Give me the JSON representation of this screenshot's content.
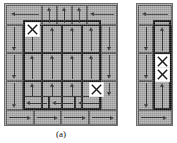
{
  "figure": {
    "caption": "(a)",
    "colors": {
      "grain_fill": "#a9a9a9",
      "grain_border": "#5a5a5a",
      "domain_wall": "#111111",
      "arrow": "#2e2e2e",
      "defect_box": "#ffffff",
      "page_background": "#ffffff"
    },
    "panels": [
      {
        "id": "panel-a",
        "name": "left-panel",
        "label": "(a)",
        "x": 4,
        "y": 3,
        "width": 114,
        "height": 123,
        "domain_wall": {
          "x": 18,
          "y": 16,
          "width": 78,
          "height": 90
        },
        "cells": [
          {
            "x": 1,
            "y": 1,
            "w": 36,
            "h": 20,
            "thick": false
          },
          {
            "x": 37,
            "y": 1,
            "w": 15,
            "h": 20,
            "thick": false
          },
          {
            "x": 52,
            "y": 1,
            "w": 15,
            "h": 20,
            "thick": false
          },
          {
            "x": 67,
            "y": 1,
            "w": 15,
            "h": 20,
            "thick": false
          },
          {
            "x": 82,
            "y": 1,
            "w": 30,
            "h": 20,
            "thick": false
          },
          {
            "x": 1,
            "y": 21,
            "w": 17,
            "h": 28,
            "thick": false
          },
          {
            "x": 18,
            "y": 21,
            "w": 19,
            "h": 28,
            "thick": true
          },
          {
            "x": 37,
            "y": 21,
            "w": 20,
            "h": 28,
            "thick": true
          },
          {
            "x": 57,
            "y": 21,
            "w": 20,
            "h": 28,
            "thick": true
          },
          {
            "x": 77,
            "y": 21,
            "w": 19,
            "h": 28,
            "thick": true
          },
          {
            "x": 96,
            "y": 21,
            "w": 16,
            "h": 28,
            "thick": false
          },
          {
            "x": 1,
            "y": 49,
            "w": 17,
            "h": 28,
            "thick": false
          },
          {
            "x": 18,
            "y": 49,
            "w": 19,
            "h": 28,
            "thick": true
          },
          {
            "x": 37,
            "y": 49,
            "w": 20,
            "h": 28,
            "thick": true
          },
          {
            "x": 57,
            "y": 49,
            "w": 20,
            "h": 28,
            "thick": true
          },
          {
            "x": 77,
            "y": 49,
            "w": 19,
            "h": 28,
            "thick": true
          },
          {
            "x": 96,
            "y": 49,
            "w": 16,
            "h": 28,
            "thick": false
          },
          {
            "x": 1,
            "y": 77,
            "w": 17,
            "h": 29,
            "thick": false
          },
          {
            "x": 18,
            "y": 77,
            "w": 19,
            "h": 29,
            "thick": true
          },
          {
            "x": 37,
            "y": 77,
            "w": 20,
            "h": 29,
            "thick": true
          },
          {
            "x": 57,
            "y": 77,
            "w": 20,
            "h": 29,
            "thick": true
          },
          {
            "x": 77,
            "y": 77,
            "w": 19,
            "h": 29,
            "thick": true
          },
          {
            "x": 96,
            "y": 77,
            "w": 16,
            "h": 29,
            "thick": false
          },
          {
            "x": 18,
            "y": 92,
            "w": 26,
            "h": 14,
            "thick": true
          },
          {
            "x": 44,
            "y": 92,
            "w": 26,
            "h": 14,
            "thick": true
          },
          {
            "x": 70,
            "y": 92,
            "w": 26,
            "h": 14,
            "thick": true
          },
          {
            "x": 1,
            "y": 106,
            "w": 28,
            "h": 15,
            "thick": false
          },
          {
            "x": 29,
            "y": 106,
            "w": 27,
            "h": 15,
            "thick": false
          },
          {
            "x": 56,
            "y": 106,
            "w": 28,
            "h": 15,
            "thick": false
          },
          {
            "x": 84,
            "y": 106,
            "w": 28,
            "h": 15,
            "thick": false
          }
        ],
        "arrows": [
          {
            "dir": "left",
            "x": 6,
            "y": 5,
            "w": 28,
            "h": 10
          },
          {
            "dir": "up",
            "x": 40,
            "y": 3,
            "w": 8,
            "h": 16
          },
          {
            "dir": "up",
            "x": 55,
            "y": 3,
            "w": 8,
            "h": 16
          },
          {
            "dir": "up",
            "x": 70,
            "y": 3,
            "w": 8,
            "h": 16
          },
          {
            "dir": "left",
            "x": 85,
            "y": 5,
            "w": 24,
            "h": 10
          },
          {
            "dir": "down",
            "x": 5,
            "y": 23,
            "w": 8,
            "h": 24
          },
          {
            "dir": "up",
            "x": 23,
            "y": 23,
            "w": 8,
            "h": 24
          },
          {
            "dir": "up",
            "x": 43,
            "y": 23,
            "w": 8,
            "h": 24
          },
          {
            "dir": "up",
            "x": 63,
            "y": 23,
            "w": 8,
            "h": 24
          },
          {
            "dir": "up",
            "x": 82,
            "y": 23,
            "w": 8,
            "h": 24
          },
          {
            "dir": "down",
            "x": 100,
            "y": 23,
            "w": 8,
            "h": 24
          },
          {
            "dir": "down",
            "x": 5,
            "y": 51,
            "w": 8,
            "h": 24
          },
          {
            "dir": "up",
            "x": 23,
            "y": 51,
            "w": 8,
            "h": 24
          },
          {
            "dir": "up",
            "x": 43,
            "y": 51,
            "w": 8,
            "h": 24
          },
          {
            "dir": "up",
            "x": 63,
            "y": 51,
            "w": 8,
            "h": 24
          },
          {
            "dir": "up",
            "x": 82,
            "y": 51,
            "w": 8,
            "h": 24
          },
          {
            "dir": "down",
            "x": 100,
            "y": 51,
            "w": 8,
            "h": 24
          },
          {
            "dir": "down",
            "x": 5,
            "y": 79,
            "w": 8,
            "h": 25
          },
          {
            "dir": "up",
            "x": 23,
            "y": 79,
            "w": 8,
            "h": 13
          },
          {
            "dir": "up",
            "x": 43,
            "y": 79,
            "w": 8,
            "h": 13
          },
          {
            "dir": "up",
            "x": 63,
            "y": 79,
            "w": 8,
            "h": 13
          },
          {
            "dir": "up",
            "x": 82,
            "y": 79,
            "w": 8,
            "h": 13
          },
          {
            "dir": "down",
            "x": 100,
            "y": 79,
            "w": 8,
            "h": 13
          },
          {
            "dir": "left",
            "x": 21,
            "y": 94,
            "w": 21,
            "h": 10
          },
          {
            "dir": "left",
            "x": 47,
            "y": 94,
            "w": 21,
            "h": 10
          },
          {
            "dir": "left",
            "x": 73,
            "y": 94,
            "w": 21,
            "h": 10
          },
          {
            "dir": "right",
            "x": 4,
            "y": 108,
            "w": 22,
            "h": 11
          },
          {
            "dir": "right",
            "x": 32,
            "y": 108,
            "w": 21,
            "h": 11
          },
          {
            "dir": "right",
            "x": 59,
            "y": 108,
            "w": 22,
            "h": 11
          },
          {
            "dir": "right",
            "x": 87,
            "y": 108,
            "w": 22,
            "h": 11
          }
        ],
        "defects": [
          {
            "name": "defect-marker-top-left",
            "x": 20,
            "y": 18,
            "size": 13
          },
          {
            "name": "defect-marker-bottom-right",
            "x": 84,
            "y": 78,
            "size": 13
          }
        ]
      },
      {
        "id": "panel-b",
        "name": "right-panel",
        "label": "",
        "x": 136,
        "y": 3,
        "width": 37,
        "height": 123,
        "domain_wall": {
          "x": 16,
          "y": 16,
          "width": 18,
          "height": 90
        },
        "cells": [
          {
            "x": 1,
            "y": 1,
            "w": 34,
            "h": 20,
            "thick": false
          },
          {
            "x": 1,
            "y": 21,
            "w": 15,
            "h": 28,
            "thick": false
          },
          {
            "x": 16,
            "y": 21,
            "w": 19,
            "h": 28,
            "thick": true
          },
          {
            "x": 1,
            "y": 49,
            "w": 15,
            "h": 28,
            "thick": false
          },
          {
            "x": 16,
            "y": 49,
            "w": 19,
            "h": 28,
            "thick": true
          },
          {
            "x": 1,
            "y": 77,
            "w": 15,
            "h": 29,
            "thick": false
          },
          {
            "x": 16,
            "y": 77,
            "w": 19,
            "h": 29,
            "thick": true
          },
          {
            "x": 1,
            "y": 106,
            "w": 34,
            "h": 15,
            "thick": false
          }
        ],
        "arrows": [
          {
            "dir": "left",
            "x": 5,
            "y": 5,
            "w": 26,
            "h": 10
          },
          {
            "dir": "down",
            "x": 5,
            "y": 23,
            "w": 8,
            "h": 24
          },
          {
            "dir": "up",
            "x": 21,
            "y": 23,
            "w": 8,
            "h": 24
          },
          {
            "dir": "down",
            "x": 5,
            "y": 51,
            "w": 8,
            "h": 24
          },
          {
            "dir": "down",
            "x": 5,
            "y": 79,
            "w": 8,
            "h": 25
          },
          {
            "dir": "up",
            "x": 21,
            "y": 79,
            "w": 8,
            "h": 25
          },
          {
            "dir": "right",
            "x": 4,
            "y": 108,
            "w": 26,
            "h": 11
          }
        ],
        "defects": [
          {
            "name": "defect-marker-upper",
            "x": 18,
            "y": 50,
            "size": 13
          },
          {
            "name": "defect-marker-lower",
            "x": 18,
            "y": 63,
            "size": 13
          }
        ]
      }
    ]
  }
}
